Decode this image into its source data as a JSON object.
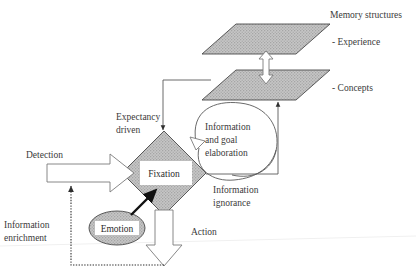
{
  "figure": {
    "background_color": "#ffffff",
    "shape_fill_color": "#b8b8b8",
    "outline_color": "#4a4a4a",
    "text_color": "#3a3a3a"
  },
  "memory": {
    "group_label": "Memory structures",
    "layers": [
      {
        "label": "- Experience"
      },
      {
        "label": "- Concepts"
      }
    ]
  },
  "nodes": {
    "fixation": "Fixation",
    "emotion": "Emotion"
  },
  "labels": {
    "expectancy_driven": "Expectancy",
    "expectancy_driven_line2": "driven",
    "information_and_goal": "Information",
    "information_and_goal_line2": "and goal",
    "information_and_goal_line3": "elaboration",
    "information_ignorance": "Information",
    "information_ignorance_line2": "ignorance",
    "detection": "Detection",
    "information_enrichment": "Information",
    "information_enrichment_line2": "enrichment",
    "action": "Action"
  }
}
